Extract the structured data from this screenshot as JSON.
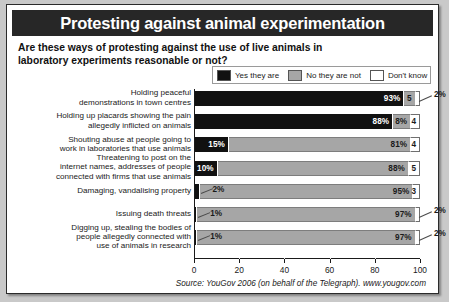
{
  "title": "Protesting against animal experimentation",
  "question": "Are these ways of protesting against the use of live animals in laboratory experiments reasonable or not?",
  "source": "Source: YouGov 2006 (on behalf of the Telegraph). www.yougov.com",
  "legend": [
    {
      "label": "Yes they are",
      "color": "#111111",
      "key": "yes"
    },
    {
      "label": "No they are not",
      "color": "#a6a6a6",
      "key": "no"
    },
    {
      "label": "Don't know",
      "color": "#ffffff",
      "key": "dk"
    }
  ],
  "chart_data": {
    "type": "bar",
    "orientation": "horizontal",
    "stacked": true,
    "title": "Protesting against animal experimentation",
    "subtitle": "Are these ways of protesting against the use of live animals in laboratory experiments reasonable or not?",
    "xlabel": "",
    "ylabel": "",
    "xlim": [
      0,
      100
    ],
    "xticks": [
      0,
      20,
      40,
      60,
      80,
      100
    ],
    "grid": true,
    "legend_position": "top-right",
    "categories": [
      "Holding peaceful demonstrations in town centres",
      "Holding up placards showing the pain allegedly inflicted on animals",
      "Shouting abuse at people going to work in laboratories that use animals",
      "Threatening to post on the internet names, addresses of people connected with firms that use animals",
      "Damaging, vandalising property",
      "Issuing death threats",
      "Digging up, stealing the bodies of people allegedly connected with use of animals in research"
    ],
    "series": [
      {
        "name": "Yes they are",
        "values": [
          93,
          88,
          15,
          10,
          2,
          1,
          1
        ]
      },
      {
        "name": "No they are not",
        "values": [
          5,
          8,
          81,
          85,
          95,
          97,
          97
        ]
      },
      {
        "name": "Don't know",
        "values": [
          2,
          4,
          4,
          5,
          3,
          2,
          2
        ]
      }
    ]
  },
  "rows": [
    {
      "label_lines": [
        "Holding peaceful",
        "demonstrations in town centres"
      ],
      "yes": 93,
      "no": 5,
      "dk": 2,
      "yes_text": "93%",
      "no_text": "5",
      "dk_text": "2%",
      "yes_inside": true,
      "no_inside": true,
      "dk_callout": true
    },
    {
      "label_lines": [
        "Holding up placards showing the pain",
        "allegedly inflicted on animals"
      ],
      "yes": 88,
      "no": 8,
      "dk": 4,
      "yes_text": "88%",
      "no_text": "8%",
      "dk_text": "4",
      "yes_inside": true,
      "no_inside": true,
      "dk_callout": false
    },
    {
      "label_lines": [
        "Shouting abuse at people going to",
        "work in laboratories that use animals"
      ],
      "yes": 15,
      "no": 81,
      "dk": 4,
      "yes_text": "15%",
      "no_text": "81%",
      "dk_text": "4",
      "yes_inside": true,
      "no_inside": true,
      "dk_callout": false
    },
    {
      "label_lines": [
        "Threatening to post on the",
        "internet names, addresses of people",
        "connected with firms that use animals"
      ],
      "yes": 10,
      "no": 85,
      "dk": 5,
      "yes_text": "10%",
      "no_text": "88%",
      "dk_text": "5",
      "yes_inside": true,
      "no_inside": true,
      "dk_callout": false
    },
    {
      "label_lines": [
        "Damaging, vandalising property"
      ],
      "yes": 2,
      "no": 95,
      "dk": 3,
      "yes_text": "2%",
      "no_text": "95%",
      "dk_text": "3",
      "yes_inside": false,
      "no_inside": true,
      "dk_callout": false
    },
    {
      "label_lines": [
        "Issuing death threats"
      ],
      "yes": 1,
      "no": 97,
      "dk": 2,
      "yes_text": "1%",
      "no_text": "97%",
      "dk_text": "2%",
      "yes_inside": false,
      "no_inside": true,
      "dk_callout": true
    },
    {
      "label_lines": [
        "Digging up, stealing the bodies of",
        "people allegedly connected with",
        "use of animals in research"
      ],
      "yes": 1,
      "no": 97,
      "dk": 2,
      "yes_text": "1%",
      "no_text": "97%",
      "dk_text": "2%",
      "yes_inside": false,
      "no_inside": true,
      "dk_callout": true
    }
  ],
  "axis": {
    "ticks": [
      "0",
      "20",
      "40",
      "60",
      "80",
      "100"
    ],
    "tick_values": [
      0,
      20,
      40,
      60,
      80,
      100
    ]
  }
}
